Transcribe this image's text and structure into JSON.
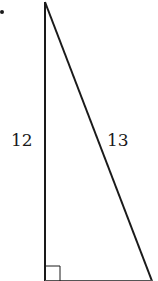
{
  "figure": {
    "type": "right-triangle",
    "bullet_marker": "•",
    "sides": {
      "vertical_leg": {
        "label": "12"
      },
      "hypotenuse": {
        "label": "13"
      },
      "horizontal_leg": {
        "label": ""
      }
    },
    "right_angle_marker": "bottom-left",
    "colors": {
      "stroke": "#1a1a1a",
      "background": "#ffffff"
    }
  }
}
